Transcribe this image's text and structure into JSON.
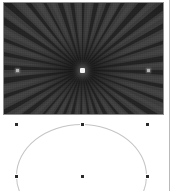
{
  "canvas": {
    "width": 172,
    "height": 191,
    "background_color": "#ffffff",
    "label": "slide-canvas"
  },
  "panel_edge": {
    "label": "adjacent-panel-divider",
    "x": 169,
    "color": "#b9b9b9"
  },
  "image_object": {
    "label": "radial-sunburst-image",
    "alt_text": "Dark grayscale radial sunburst / starburst rays converging to a bright point",
    "x": 3,
    "y": 2,
    "width": 161,
    "height": 113,
    "base_color": "#3a3a3a",
    "ray_dark_color": "#1c1c1c",
    "ray_light_color": "#4a4a4a",
    "border_color": "#8f8f8f",
    "center_x": 82,
    "center_y": 70,
    "core_color": "#f2f2f2",
    "hotspots": [
      {
        "label": "left-hotspot",
        "x": 16,
        "y": 69,
        "color": "#b5b5b5"
      },
      {
        "label": "right-hotspot",
        "x": 147,
        "y": 69,
        "color": "#b5b5b5"
      }
    ]
  },
  "shape": {
    "label": "ellipse-shape",
    "type": "ellipse",
    "x": 16,
    "y": 124,
    "width": 131,
    "height": 104,
    "stroke_color": "#c4c4c4",
    "stroke_width": 1,
    "fill": "none",
    "selected": true
  },
  "selection": {
    "label": "shape-selection-handles",
    "handle_color": "#2b2b2b",
    "handle_border_color": "#ffffff",
    "handle_size": 5,
    "handles": [
      {
        "name": "handle-top-left",
        "x": 16,
        "y": 124,
        "cursor": "nwse-resize"
      },
      {
        "name": "handle-top-center",
        "x": 82,
        "y": 124,
        "cursor": "ns-resize"
      },
      {
        "name": "handle-top-right",
        "x": 147,
        "y": 124,
        "cursor": "nesw-resize"
      },
      {
        "name": "handle-bottom-left",
        "x": 16,
        "y": 176,
        "cursor": "nesw-resize"
      },
      {
        "name": "handle-bottom-center",
        "x": 82,
        "y": 176,
        "cursor": "ns-resize"
      },
      {
        "name": "handle-bottom-right",
        "x": 147,
        "y": 176,
        "cursor": "nwse-resize"
      }
    ]
  }
}
